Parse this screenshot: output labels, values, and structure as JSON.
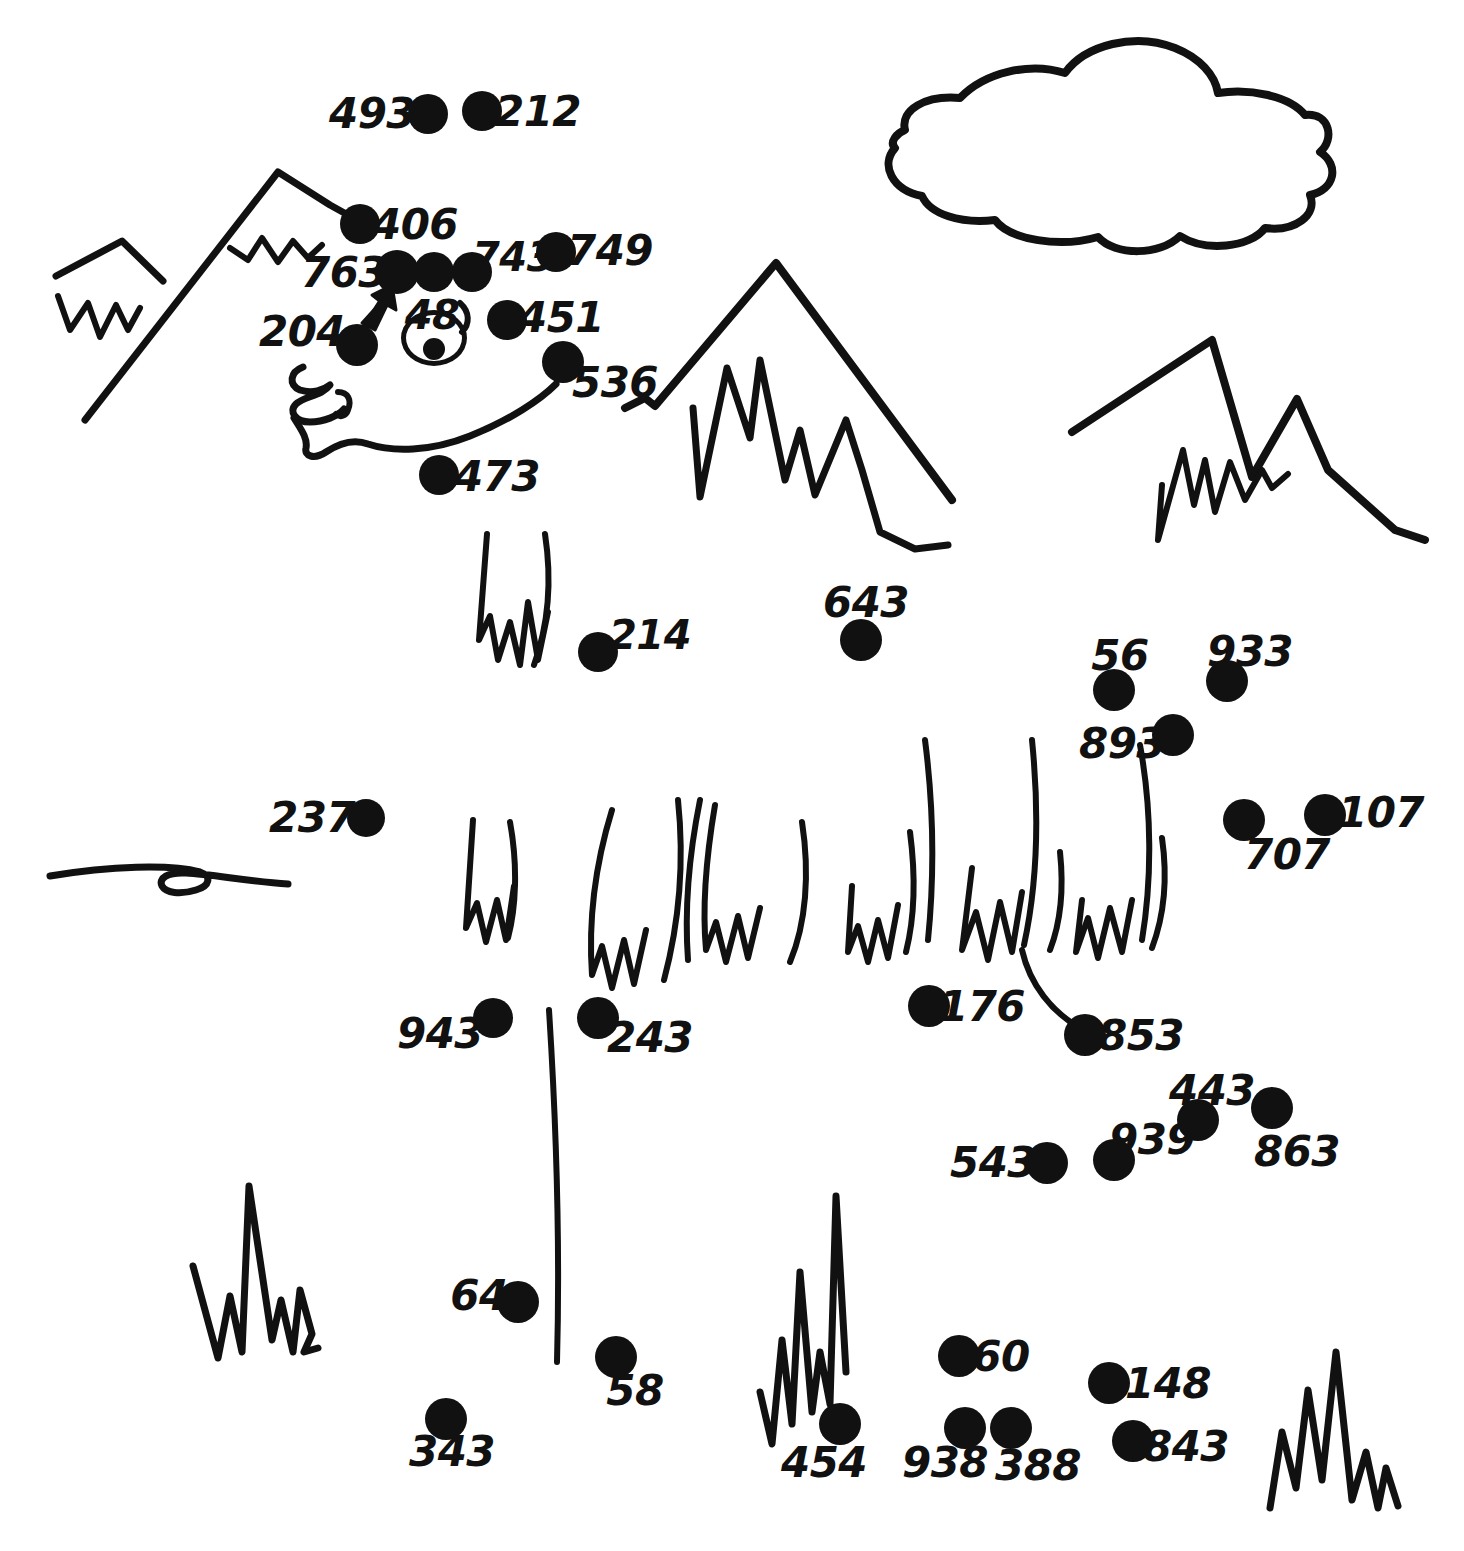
{
  "scene": {
    "title": "Connect-the-dots outdoor scene",
    "background_color": "#ffffff",
    "ink_color": "#111111",
    "width": 1464,
    "height": 1551
  },
  "watermark": {
    "text": "Illustration copyright 1987"
  },
  "dots": [
    {
      "label": "493",
      "cx": 428,
      "cy": 114,
      "r": 20,
      "lx": 372,
      "ly": 114,
      "fs": 42
    },
    {
      "label": "212",
      "cx": 482,
      "cy": 111,
      "r": 20,
      "lx": 538,
      "ly": 112,
      "fs": 42
    },
    {
      "label": "406",
      "cx": 360,
      "cy": 224,
      "r": 20,
      "lx": 415,
      "ly": 225,
      "fs": 42
    },
    {
      "label": "749",
      "cx": 556,
      "cy": 252,
      "r": 20,
      "lx": 610,
      "ly": 251,
      "fs": 42
    },
    {
      "label": "743",
      "cx": 472,
      "cy": 272,
      "r": 20,
      "lx": 513,
      "ly": 257,
      "fs": 40
    },
    {
      "label": "763",
      "cx": 397,
      "cy": 272,
      "r": 22,
      "lx": 344,
      "ly": 273,
      "fs": 42
    },
    {
      "label": "48",
      "cx": 434,
      "cy": 272,
      "r": 20,
      "lx": 432,
      "ly": 315,
      "fs": 40
    },
    {
      "label": "451",
      "cx": 507,
      "cy": 320,
      "r": 20,
      "lx": 561,
      "ly": 318,
      "fs": 42
    },
    {
      "label": "204",
      "cx": 357,
      "cy": 345,
      "r": 21,
      "lx": 302,
      "ly": 332,
      "fs": 42
    },
    {
      "label": "536",
      "cx": 563,
      "cy": 362,
      "r": 21,
      "lx": 615,
      "ly": 383,
      "fs": 42
    },
    {
      "label": "473",
      "cx": 439,
      "cy": 475,
      "r": 20,
      "lx": 497,
      "ly": 477,
      "fs": 42
    },
    {
      "label": "214",
      "cx": 598,
      "cy": 652,
      "r": 20,
      "lx": 650,
      "ly": 635,
      "fs": 40
    },
    {
      "label": "643",
      "cx": 861,
      "cy": 640,
      "r": 21,
      "lx": 866,
      "ly": 603,
      "fs": 42
    },
    {
      "label": "56",
      "cx": 1114,
      "cy": 690,
      "r": 21,
      "lx": 1120,
      "ly": 656,
      "fs": 42
    },
    {
      "label": "933",
      "cx": 1227,
      "cy": 681,
      "r": 21,
      "lx": 1250,
      "ly": 652,
      "fs": 42
    },
    {
      "label": "893",
      "cx": 1173,
      "cy": 735,
      "r": 21,
      "lx": 1122,
      "ly": 744,
      "fs": 42
    },
    {
      "label": "107",
      "cx": 1325,
      "cy": 815,
      "r": 21,
      "lx": 1381,
      "ly": 813,
      "fs": 42
    },
    {
      "label": "707",
      "cx": 1244,
      "cy": 820,
      "r": 21,
      "lx": 1287,
      "ly": 855,
      "fs": 42
    },
    {
      "label": "237",
      "cx": 366,
      "cy": 818,
      "r": 19,
      "lx": 312,
      "ly": 818,
      "fs": 42
    },
    {
      "label": "943",
      "cx": 493,
      "cy": 1018,
      "r": 20,
      "lx": 440,
      "ly": 1034,
      "fs": 42
    },
    {
      "label": "243",
      "cx": 598,
      "cy": 1018,
      "r": 21,
      "lx": 650,
      "ly": 1038,
      "fs": 42
    },
    {
      "label": "176",
      "cx": 929,
      "cy": 1006,
      "r": 21,
      "lx": 982,
      "ly": 1007,
      "fs": 42
    },
    {
      "label": "853",
      "cx": 1085,
      "cy": 1035,
      "r": 21,
      "lx": 1141,
      "ly": 1036,
      "fs": 42
    },
    {
      "label": "443",
      "cx": 1198,
      "cy": 1120,
      "r": 21,
      "lx": 1212,
      "ly": 1091,
      "fs": 42
    },
    {
      "label": "863",
      "cx": 1272,
      "cy": 1108,
      "r": 21,
      "lx": 1297,
      "ly": 1152,
      "fs": 42
    },
    {
      "label": "939",
      "cx": 1114,
      "cy": 1160,
      "r": 21,
      "lx": 1152,
      "ly": 1140,
      "fs": 42
    },
    {
      "label": "543",
      "cx": 1047,
      "cy": 1163,
      "r": 21,
      "lx": 993,
      "ly": 1163,
      "fs": 42
    },
    {
      "label": "64",
      "cx": 518,
      "cy": 1302,
      "r": 21,
      "lx": 479,
      "ly": 1296,
      "fs": 42
    },
    {
      "label": "58",
      "cx": 616,
      "cy": 1357,
      "r": 21,
      "lx": 635,
      "ly": 1391,
      "fs": 42
    },
    {
      "label": "343",
      "cx": 446,
      "cy": 1419,
      "r": 21,
      "lx": 452,
      "ly": 1452,
      "fs": 42
    },
    {
      "label": "60",
      "cx": 959,
      "cy": 1356,
      "r": 21,
      "lx": 1001,
      "ly": 1357,
      "fs": 42
    },
    {
      "label": "148",
      "cx": 1109,
      "cy": 1383,
      "r": 21,
      "lx": 1168,
      "ly": 1384,
      "fs": 42
    },
    {
      "label": "454",
      "cx": 840,
      "cy": 1424,
      "r": 21,
      "lx": 824,
      "ly": 1463,
      "fs": 42
    },
    {
      "label": "938",
      "cx": 965,
      "cy": 1428,
      "r": 21,
      "lx": 945,
      "ly": 1463,
      "fs": 42
    },
    {
      "label": "388",
      "cx": 1011,
      "cy": 1428,
      "r": 21,
      "lx": 1038,
      "ly": 1466,
      "fs": 42
    },
    {
      "label": "843",
      "cx": 1133,
      "cy": 1441,
      "r": 21,
      "lx": 1186,
      "ly": 1447,
      "fs": 42
    }
  ],
  "highlight": {
    "name": "circled-dot",
    "target_label": "48",
    "cx": 434,
    "cy": 338,
    "rx": 28,
    "ry": 23,
    "inner_dot_r": 11
  },
  "pointer_arrow": {
    "name": "arrow-to-763",
    "from_label": "204",
    "to_label": "763"
  },
  "shapes": {
    "cloud": "cloud-outline",
    "mountains": [
      "mountain-left-small",
      "mountain-left-large",
      "mountain-center",
      "mountain-right"
    ],
    "bird": "bird-outline",
    "path": "wavy-path-line",
    "grass": [
      "grass-tuft-left",
      "grass-tuft-mid-1",
      "grass-tuft-mid-2",
      "grass-tuft-mid-3",
      "grass-tuft-mid-4",
      "grass-tuft-bottom-left",
      "grass-tuft-bottom-mid",
      "grass-tuft-bottom-right"
    ],
    "stem": "long-stem-line"
  }
}
